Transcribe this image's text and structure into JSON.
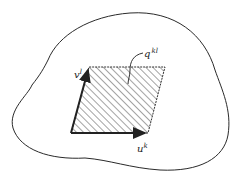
{
  "diagram": {
    "colors": {
      "stroke": "#2a2a2a",
      "hatch": "#555555",
      "background": "#ffffff"
    },
    "labels": {
      "vector_v": {
        "base": "v",
        "sup": "l"
      },
      "vector_u": {
        "base": "u",
        "sup": "k"
      },
      "area_q": {
        "base": "q",
        "sup": "kl"
      }
    }
  }
}
